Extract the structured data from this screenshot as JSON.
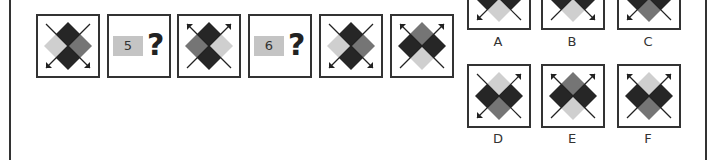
{
  "colors": {
    "dark": "#262626",
    "medium": "#757575",
    "light": "#cfcfcf",
    "border": "#333333"
  },
  "sequence": [
    {
      "type": "figure",
      "top": "dark",
      "left": "light",
      "right": "medium",
      "bottom": "dark",
      "arrows": [
        "bottom-left",
        "bottom-right"
      ]
    },
    {
      "type": "hidden",
      "number": "5",
      "mark": "?"
    },
    {
      "type": "figure",
      "top": "dark",
      "left": "medium",
      "right": "light",
      "bottom": "dark",
      "arrows": [
        "top-left",
        "top-right"
      ]
    },
    {
      "type": "hidden",
      "number": "6",
      "mark": "?"
    },
    {
      "type": "figure",
      "top": "dark",
      "left": "light",
      "right": "medium",
      "bottom": "dark",
      "arrows": [
        "bottom-left",
        "bottom-right"
      ]
    },
    {
      "type": "figure",
      "top": "medium",
      "left": "dark",
      "right": "dark",
      "bottom": "light",
      "arrows": [
        "top-left",
        "top-right"
      ]
    }
  ],
  "options": [
    {
      "label": "A",
      "top": "dark",
      "left": "dark",
      "right": "dark",
      "bottom": "light",
      "arrows": [
        "bottom-left"
      ]
    },
    {
      "label": "B",
      "top": "dark",
      "left": "dark",
      "right": "dark",
      "bottom": "light",
      "arrows": [
        "bottom-right"
      ]
    },
    {
      "label": "C",
      "top": "dark",
      "left": "dark",
      "right": "dark",
      "bottom": "medium",
      "arrows": [
        "bottom-left"
      ]
    },
    {
      "label": "D",
      "top": "light",
      "left": "dark",
      "right": "dark",
      "bottom": "medium",
      "arrows": [
        "top-right",
        "bottom-left"
      ]
    },
    {
      "label": "E",
      "top": "medium",
      "left": "dark",
      "right": "dark",
      "bottom": "light",
      "arrows": [
        "top-left",
        "top-right"
      ]
    },
    {
      "label": "F",
      "top": "light",
      "left": "dark",
      "right": "dark",
      "bottom": "medium",
      "arrows": [
        "top-left",
        "top-right"
      ]
    }
  ]
}
